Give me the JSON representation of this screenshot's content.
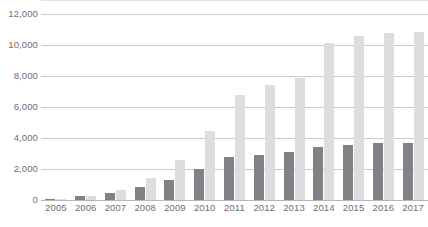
{
  "chart_data": {
    "type": "bar",
    "title": "",
    "subtitle": "",
    "xlabel": "",
    "ylabel": "",
    "grid": true,
    "legend_position": "none",
    "ylim": [
      0,
      12000
    ],
    "ytick_step": 2000,
    "ytick_labels": [
      "12,000",
      "10,000",
      "8,000",
      "6,000",
      "4,000",
      "2,000",
      "0"
    ],
    "ytick_values": [
      12000,
      10000,
      8000,
      6000,
      4000,
      2000,
      0
    ],
    "categories": [
      "2005",
      "2006",
      "2007",
      "2008",
      "2009",
      "2010",
      "2011",
      "2012",
      "2013",
      "2014",
      "2015",
      "2016",
      "2017"
    ],
    "series": [
      {
        "name": "series-a",
        "color": "#808285",
        "values": [
          80,
          250,
          450,
          850,
          1300,
          2000,
          2750,
          2900,
          3100,
          3450,
          3550,
          3650,
          3680
        ]
      },
      {
        "name": "series-b",
        "color": "#dcdddf",
        "values": [
          40,
          250,
          650,
          1450,
          2550,
          4450,
          6800,
          7400,
          7900,
          10100,
          10550,
          10800,
          10850
        ]
      }
    ]
  }
}
